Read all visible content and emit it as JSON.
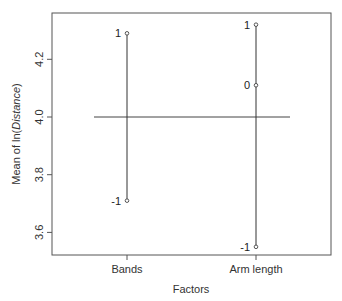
{
  "chart_data": {
    "type": "line",
    "subtype": "main-effects-plot",
    "title": "",
    "xlabel": "Factors",
    "ylabel": "Mean of ln(Distance)",
    "ylabel_parts": {
      "prefix": "Mean of ln(",
      "italic": "Distance",
      "suffix": ")"
    },
    "ylim": [
      3.52,
      4.37
    ],
    "yticks": [
      3.6,
      3.8,
      4.0,
      4.2
    ],
    "ytick_labels": [
      "3.6",
      "3.8",
      "4.0",
      "4.2"
    ],
    "categories": [
      "Bands",
      "Arm length"
    ],
    "grand_mean": 4.0,
    "grid": false,
    "legend": null,
    "series": [
      {
        "name": "Bands",
        "points": [
          {
            "level": "1",
            "value": 4.29
          },
          {
            "level": "-1",
            "value": 3.71
          }
        ]
      },
      {
        "name": "Arm length",
        "points": [
          {
            "level": "1",
            "value": 4.32
          },
          {
            "level": "0",
            "value": 4.11
          },
          {
            "level": "-1",
            "value": 3.55
          }
        ]
      }
    ]
  }
}
